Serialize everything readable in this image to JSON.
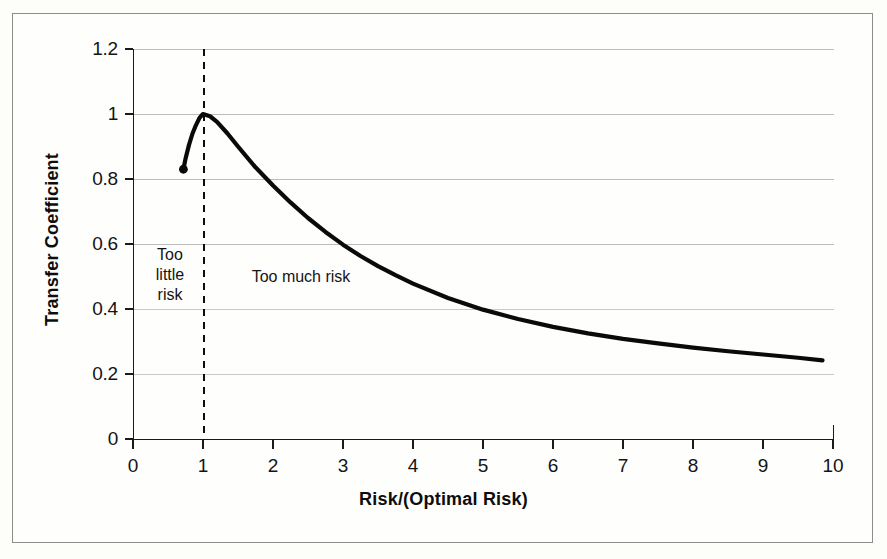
{
  "chart_data": {
    "type": "line",
    "title": "",
    "xlabel": "Risk/(Optimal Risk)",
    "ylabel": "Transfer Coefficient",
    "xlim": [
      0,
      10
    ],
    "ylim": [
      0,
      1.2
    ],
    "grid": true,
    "legend": null,
    "x_ticks": [
      "0",
      "1",
      "2",
      "3",
      "4",
      "5",
      "6",
      "7",
      "8",
      "9",
      "10"
    ],
    "y_ticks": [
      "0",
      "0.2",
      "0.4",
      "0.6",
      "0.8",
      "1",
      "1.2"
    ],
    "series": [
      {
        "name": "Transfer Coefficient",
        "start_marker": {
          "x": 0.72,
          "y": 0.83
        },
        "x": [
          0.72,
          0.75,
          0.8,
          0.85,
          0.9,
          0.95,
          1.0,
          1.1,
          1.2,
          1.35,
          1.5,
          1.75,
          2.0,
          2.25,
          2.5,
          2.75,
          3.0,
          3.25,
          3.5,
          3.75,
          4.0,
          4.5,
          5.0,
          5.5,
          6.0,
          6.5,
          7.0,
          7.5,
          8.0,
          8.5,
          9.0,
          9.5,
          9.85
        ],
        "y": [
          0.83,
          0.862,
          0.905,
          0.94,
          0.966,
          0.988,
          1.0,
          0.993,
          0.976,
          0.94,
          0.9,
          0.836,
          0.78,
          0.728,
          0.68,
          0.637,
          0.598,
          0.563,
          0.532,
          0.504,
          0.478,
          0.434,
          0.398,
          0.369,
          0.345,
          0.325,
          0.308,
          0.294,
          0.281,
          0.27,
          0.26,
          0.25,
          0.242
        ]
      }
    ],
    "annotations": [
      {
        "id": "optimal-risk-divider",
        "type": "vertical-dashed-line",
        "x": 1
      },
      {
        "id": "too-little-risk",
        "type": "text",
        "text": "Too little risk",
        "lines": [
          "Too",
          "little",
          "risk"
        ]
      },
      {
        "id": "too-much-risk",
        "type": "text",
        "text": "Too much risk",
        "lines": [
          "Too much risk"
        ]
      }
    ],
    "colors": {
      "curve": "#0a0a0a",
      "axis": "#1a1a1a",
      "grid": "#b9b9b9",
      "frame": "#8d8d8d",
      "background": "#fdfdfa",
      "text": "#141414"
    }
  }
}
